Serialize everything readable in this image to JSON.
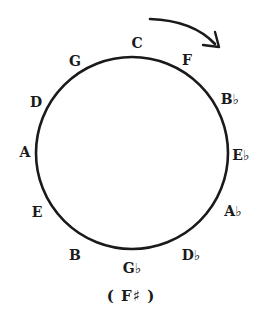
{
  "diagram": {
    "direction_arrow": "clockwise-arrow",
    "colors": {
      "ink": "#1a1a1a",
      "background": "#ffffff"
    },
    "circle": {
      "cx": 132,
      "cy": 153,
      "r": 96
    },
    "keys": [
      {
        "label": "C",
        "x": 137,
        "y": 43
      },
      {
        "label": "F",
        "x": 187,
        "y": 60
      },
      {
        "label": "B♭",
        "x": 230,
        "y": 99
      },
      {
        "label": "E♭",
        "x": 241,
        "y": 155
      },
      {
        "label": "A♭",
        "x": 233,
        "y": 211
      },
      {
        "label": "D♭",
        "x": 191,
        "y": 255
      },
      {
        "label": "G♭",
        "x": 132,
        "y": 268
      },
      {
        "label": "B",
        "x": 75,
        "y": 255
      },
      {
        "label": "E",
        "x": 37,
        "y": 212
      },
      {
        "label": "A",
        "x": 25,
        "y": 152
      },
      {
        "label": "D",
        "x": 36,
        "y": 102
      },
      {
        "label": "G",
        "x": 75,
        "y": 61
      }
    ],
    "enharmonic": {
      "label": "( F♯ )",
      "x": 131,
      "y": 296
    }
  }
}
